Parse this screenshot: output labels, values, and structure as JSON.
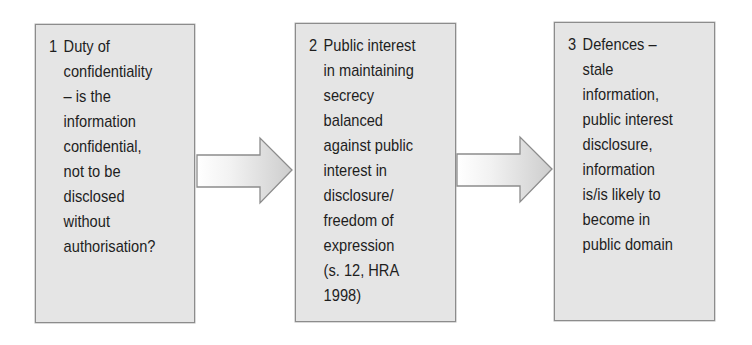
{
  "diagram": {
    "type": "flow",
    "direction": "left-to-right",
    "colors": {
      "box_fill": "#e5e5e5",
      "box_border": "#8c8c8c",
      "text": "#1e1e1e",
      "arrow_fill_light": "#ffffff",
      "arrow_fill_dark": "#cfcfcf",
      "arrow_stroke": "#8c8c8c"
    },
    "steps": [
      {
        "number": "1",
        "lines": [
          "Duty of",
          "confidentiality",
          "– is the",
          "information",
          "confidential,",
          "not to be",
          "disclosed",
          "without",
          "authorisation?"
        ]
      },
      {
        "number": "2",
        "lines": [
          "Public interest",
          "in maintaining",
          "secrecy",
          "balanced",
          "against public",
          "interest in",
          "disclosure/",
          "freedom of",
          "expression",
          "(s. 12, HRA",
          "1998)"
        ]
      },
      {
        "number": "3",
        "lines": [
          "Defences –",
          "stale",
          "information,",
          "public interest",
          "disclosure,",
          "information",
          "is/is likely to",
          "become in",
          "public domain"
        ]
      }
    ],
    "connectors": [
      {
        "from": "1",
        "to": "2",
        "icon": "right-arrow-icon"
      },
      {
        "from": "2",
        "to": "3",
        "icon": "right-arrow-icon"
      }
    ]
  }
}
